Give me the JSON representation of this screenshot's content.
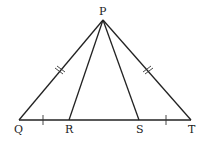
{
  "diagram": {
    "type": "geometry-triangle",
    "points": {
      "P": {
        "label": "P",
        "x": 103,
        "y": 20
      },
      "Q": {
        "label": "Q",
        "x": 19,
        "y": 120
      },
      "R": {
        "label": "R",
        "x": 69,
        "y": 120
      },
      "S": {
        "label": "S",
        "x": 139,
        "y": 120
      },
      "T": {
        "label": "T",
        "x": 191,
        "y": 120
      }
    },
    "segments": [
      "PQ",
      "PR",
      "PS",
      "PT",
      "QT"
    ],
    "congruence_marks": {
      "single": [
        "QR",
        "ST"
      ],
      "double": [
        "PQ",
        "PT"
      ]
    },
    "colors": {
      "stroke": "#222222",
      "background": "#ffffff"
    }
  }
}
